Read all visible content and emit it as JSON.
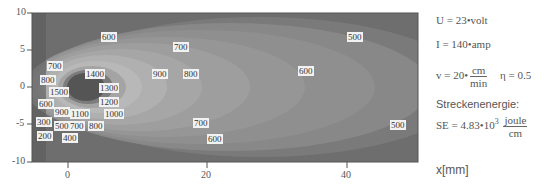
{
  "chart_data": {
    "type": "heatmap",
    "subtype": "contour",
    "title": "",
    "xlabel": "x[mm]",
    "ylabel": "",
    "xlim": [
      -8,
      50
    ],
    "ylim": [
      -10,
      10
    ],
    "x_ticks": [
      "0",
      "20",
      "40"
    ],
    "y_ticks": [
      "10",
      "5",
      "0",
      "-5",
      "-10"
    ],
    "contour_levels": [
      200,
      300,
      400,
      500,
      600,
      700,
      800,
      900,
      1000,
      1100,
      1200,
      1300,
      1400,
      1500
    ],
    "contour_labels": [
      {
        "text": "600",
        "x": 108,
        "y": 37
      },
      {
        "text": "700",
        "x": 180,
        "y": 47
      },
      {
        "text": "500",
        "x": 354,
        "y": 37
      },
      {
        "text": "700",
        "x": 54,
        "y": 66
      },
      {
        "text": "1400",
        "x": 92,
        "y": 74
      },
      {
        "text": "900",
        "x": 159,
        "y": 74
      },
      {
        "text": "800",
        "x": 190,
        "y": 74
      },
      {
        "text": "600",
        "x": 305,
        "y": 71
      },
      {
        "text": "800",
        "x": 47,
        "y": 80
      },
      {
        "text": "1500",
        "x": 56,
        "y": 92
      },
      {
        "text": "1300",
        "x": 106,
        "y": 88
      },
      {
        "text": "600",
        "x": 45,
        "y": 104
      },
      {
        "text": "1200",
        "x": 106,
        "y": 102
      },
      {
        "text": "900",
        "x": 61,
        "y": 112
      },
      {
        "text": "1100",
        "x": 77,
        "y": 114
      },
      {
        "text": "1000",
        "x": 111,
        "y": 114
      },
      {
        "text": "300",
        "x": 43,
        "y": 122
      },
      {
        "text": "500",
        "x": 61,
        "y": 126
      },
      {
        "text": "700",
        "x": 76,
        "y": 126
      },
      {
        "text": "800",
        "x": 95,
        "y": 126
      },
      {
        "text": "700",
        "x": 200,
        "y": 123
      },
      {
        "text": "500",
        "x": 397,
        "y": 125
      },
      {
        "text": "200",
        "x": 44,
        "y": 136
      },
      {
        "text": "400",
        "x": 69,
        "y": 138
      },
      {
        "text": "600",
        "x": 214,
        "y": 139
      }
    ],
    "grid": false,
    "legend": "none"
  },
  "side": {
    "U": "U = 23•volt",
    "I": "I = 140•amp",
    "v_prefix": "v = 20•",
    "v_num": "cm",
    "v_den": "min",
    "eta": "η = 0.5",
    "heading": "Streckenenergie:",
    "se_prefix": "SE = 4.83•10",
    "se_exp": "3",
    "se_num": "joule",
    "se_den": "cm",
    "xaxis_label": "x[mm]"
  }
}
